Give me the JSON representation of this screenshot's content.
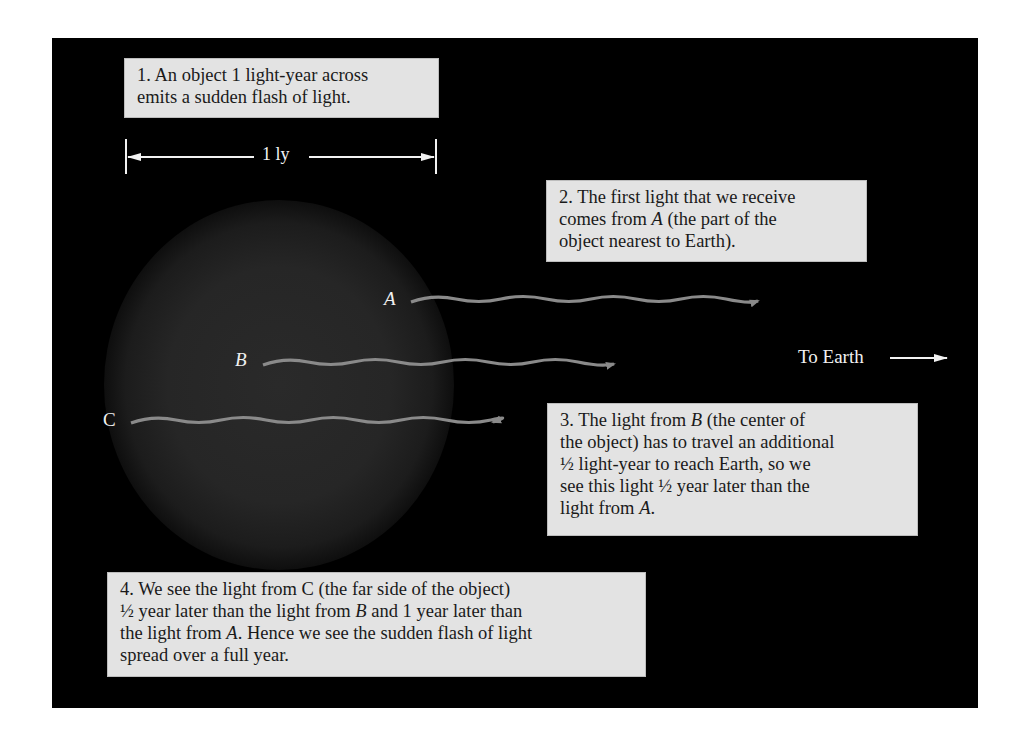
{
  "figure": {
    "colors": {
      "background": "#000000",
      "caption_box": "#e3e3e3",
      "wave": "#8a8a8a",
      "annotation": "#f0f0f0",
      "object_glow": "#2a2a2a"
    },
    "measure": {
      "label": "1 ly"
    },
    "points": [
      {
        "id": "A",
        "label": "A"
      },
      {
        "id": "B",
        "label": "B"
      },
      {
        "id": "C",
        "label": "C"
      }
    ],
    "direction_label": "To Earth",
    "captions": [
      {
        "lines": [
          "1. An object 1 light-year across",
          "emits a sudden flash of light."
        ]
      },
      {
        "parts": [
          "2. The first light that we receive",
          "comes from ",
          "A",
          " (the part of the",
          "object nearest to Earth)."
        ]
      },
      {
        "parts": [
          "3. The light from ",
          "B",
          " (the center of",
          "the object) has to travel an additional",
          "½ light-year to reach Earth, so we",
          "see this light ½ year later than the",
          "light from ",
          "A",
          "."
        ]
      },
      {
        "parts": [
          "4. We see the light from ",
          "C",
          " (the far side of the object)",
          "½ year later than the light from ",
          "B",
          " and 1 year later than",
          "the light from ",
          "A",
          ". Hence we see the sudden flash of light",
          "spread over a full year."
        ]
      }
    ]
  }
}
